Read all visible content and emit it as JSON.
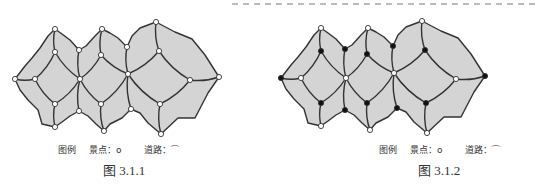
{
  "figures": [
    {
      "id": "fig-3-1-1",
      "caption": "图 3.1.1",
      "legend": {
        "title": "图例",
        "spot_label": "景点：",
        "spot_symbol": "o",
        "road_label": "道路："
      },
      "black_nodes": []
    },
    {
      "id": "fig-3-1-2",
      "caption": "图 3.1.2",
      "legend": {
        "title": "图例",
        "spot_label": "景点：",
        "spot_symbol": "o",
        "road_label": "道路："
      },
      "black_nodes": [
        "lt",
        "u1",
        "l1",
        "ru1",
        "lb1",
        "u2",
        "l2",
        "u3",
        "lw3",
        "ui3",
        "li3",
        "rt"
      ]
    }
  ],
  "colors": {
    "region": "#d4d4d4",
    "road": "#333333",
    "node_open": "#ffffff",
    "node_filled": "#111111",
    "dash": "#b0b0b0"
  }
}
